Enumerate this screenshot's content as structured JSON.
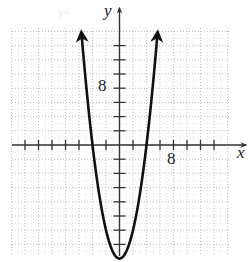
{
  "chart_data": {
    "type": "line",
    "title": "",
    "function": "y = x^2 - 16",
    "xlabel": "x",
    "ylabel": "y",
    "xlim": [
      -16,
      16
    ],
    "ylim": [
      -16,
      16
    ],
    "x_tick_step": 2,
    "y_tick_step": 2,
    "x_tick_labels": [
      {
        "value": 8,
        "label": "8"
      }
    ],
    "y_tick_labels": [
      {
        "value": 8,
        "label": "8"
      }
    ],
    "grid": true,
    "grid_style": "dotted",
    "series": [
      {
        "name": "parabola",
        "x": [
          -5.6,
          -5,
          -4,
          -3,
          -2,
          -1,
          0,
          1,
          2,
          3,
          4,
          5,
          5.6
        ],
        "values": [
          15.4,
          9,
          0,
          -7,
          -12,
          -15,
          -16,
          -15,
          -12,
          -7,
          0,
          9,
          15.4
        ],
        "arrows_at_ends": true
      }
    ],
    "vertex": [
      0,
      -16
    ],
    "x_intercepts": [
      -4,
      4
    ],
    "legend": null
  },
  "labels": {
    "x_axis": "x",
    "y_axis": "y",
    "x_tick": "8",
    "y_tick": "8"
  },
  "colors": {
    "curve": "#111111",
    "axis": "#333333",
    "grid": "#b5b5b5"
  }
}
